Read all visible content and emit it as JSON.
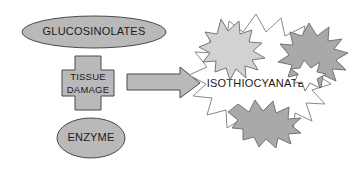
{
  "diagram": {
    "type": "process-flow",
    "colors": {
      "shape_fill": "#b9b9b9",
      "shape_stroke": "#4a4a4a",
      "arrow_fill": "#b9b9b9",
      "burst_light": "#d2d2d2",
      "burst_mid": "#a9a9a9",
      "burst_dark": "#9e9e9e",
      "burst_outline_fill": "#ffffff",
      "text": "#1a1a1a",
      "background": "#ffffff"
    },
    "nodes": [
      {
        "id": "glucosinolates",
        "shape": "ellipse",
        "label": "GLUCOSINOLATES",
        "cx": 94,
        "cy": 32,
        "rx": 72,
        "ry": 16
      },
      {
        "id": "tissue-damage",
        "shape": "cross",
        "label_line1": "TISSUE",
        "label_line2": "DAMAGE",
        "cx": 88,
        "cy": 83
      },
      {
        "id": "enzyme",
        "shape": "ellipse",
        "label": "ENZYME",
        "cx": 91,
        "cy": 138,
        "rx": 34,
        "ry": 20
      },
      {
        "id": "isothiocyanate",
        "shape": "starburst",
        "label": "ISOTHIOCYANATE",
        "cx": 256,
        "cy": 83
      }
    ],
    "connectors": [
      {
        "id": "arrow-right",
        "from": "tissue-damage",
        "to": "isothiocyanate",
        "direction": "right"
      }
    ],
    "decorations": [
      {
        "id": "burst-top-left",
        "fill": "#d2d2d2"
      },
      {
        "id": "burst-top-right",
        "fill": "#a9a9a9"
      },
      {
        "id": "burst-bottom",
        "fill": "#a9a9a9"
      }
    ]
  }
}
